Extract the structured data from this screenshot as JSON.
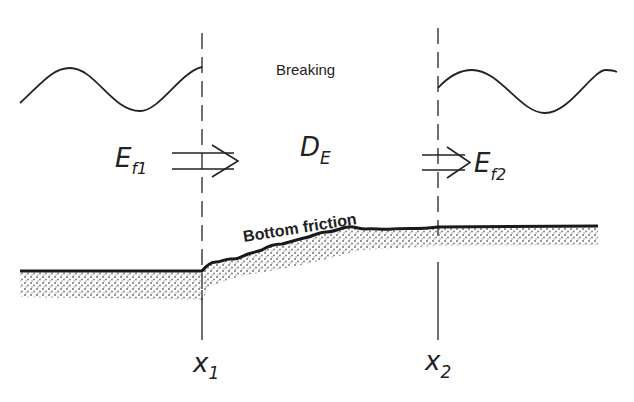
{
  "diagram": {
    "labels": {
      "breaking": "Breaking",
      "bottom_friction": "Bottom friction",
      "dissipation_main": "D",
      "dissipation_sub": "E",
      "flux_in_main": "E",
      "flux_in_sub": "f1",
      "flux_out_main": "E",
      "flux_out_sub": "f2",
      "x1_main": "x",
      "x1_sub": "1",
      "x2_main": "x",
      "x2_sub": "2"
    },
    "colors": {
      "line": "#222222",
      "sediment": "#555555",
      "background": "#ffffff"
    }
  }
}
